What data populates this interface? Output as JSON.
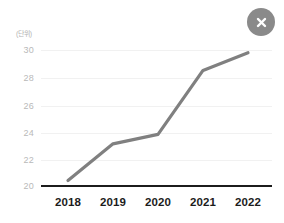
{
  "card": {
    "close_button_label": "✕",
    "close_icon_name": "close-icon"
  },
  "chart_data": {
    "type": "line",
    "title": "",
    "subtitle": "",
    "unit_label": "(단위)",
    "xlabel": "",
    "ylabel": "",
    "categories": [
      "2018",
      "2019",
      "2020",
      "2021",
      "2022"
    ],
    "values": [
      20.4,
      23.1,
      23.8,
      28.5,
      29.8
    ],
    "series": [
      {
        "name": "",
        "values": [
          20.4,
          23.1,
          23.8,
          28.5,
          29.8
        ]
      }
    ],
    "ylim": [
      20,
      30
    ],
    "ytick_labels": [
      "30",
      "28",
      "26",
      "24",
      "22",
      "20"
    ],
    "ytick_values": [
      30,
      28,
      26,
      24,
      22,
      20
    ],
    "xtick_labels": [
      "2018",
      "2019",
      "2020",
      "2021",
      "2022"
    ],
    "grid": true,
    "legend": false,
    "legend_position": "none",
    "line_color": "#808080",
    "grid_color": "#f1f1f1",
    "axis_color": "#1c1c1c",
    "background_color": "#ffffff",
    "annotations": []
  }
}
